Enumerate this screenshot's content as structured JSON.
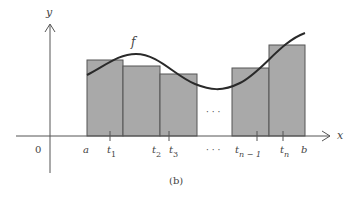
{
  "figure": {
    "caption": "(b)",
    "function_label": "f",
    "axes": {
      "x_label": "x",
      "y_label": "y",
      "origin_label": "0"
    },
    "interval": {
      "start_label": "a",
      "end_label": "b"
    },
    "tick_labels": {
      "t1": "t",
      "t1_sub": "1",
      "t2": "t",
      "t2_sub": "2",
      "t3": "t",
      "t3_sub": "3",
      "tn1": "t",
      "tn1_sub": "n − 1",
      "tn": "t",
      "tn_sub": "n"
    },
    "ellipsis_inside": "· · ·",
    "ellipsis_axis": "· · ·",
    "colors": {
      "rect_fill": "#a9a9a9",
      "rect_stroke": "#555555",
      "curve": "#2a2a2a",
      "axis": "#555555"
    },
    "rectangles": [
      {
        "x0": 87,
        "x1": 123,
        "top": 60
      },
      {
        "x0": 123,
        "x1": 160,
        "top": 66
      },
      {
        "x0": 160,
        "x1": 197,
        "top": 74
      },
      {
        "x0": 232,
        "x1": 269,
        "top": 68
      },
      {
        "x0": 269,
        "x1": 305,
        "top": 45
      }
    ]
  }
}
